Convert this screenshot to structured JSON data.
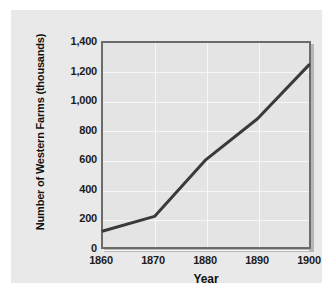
{
  "chart_data": {
    "type": "line",
    "title": "",
    "xlabel": "Year",
    "ylabel": "Number of Western Farms (thousands)",
    "x": [
      1860,
      1870,
      1880,
      1890,
      1900
    ],
    "values": [
      110,
      210,
      600,
      880,
      1250
    ],
    "series": [
      {
        "name": "Number of Western Farms",
        "values": [
          110,
          210,
          600,
          880,
          1250
        ]
      }
    ],
    "xticklabels": [
      "1860",
      "1870",
      "1880",
      "1890",
      "1900"
    ],
    "yticks": [
      0,
      200,
      400,
      600,
      800,
      1000,
      1200,
      1400
    ],
    "yticklabels": [
      "0",
      "200",
      "400",
      "600",
      "800",
      "1,000",
      "1,200",
      "1,400"
    ],
    "xlim": [
      1860,
      1900
    ],
    "ylim": [
      0,
      1400
    ],
    "grid": true,
    "legend": false,
    "line_color": "#3a3a3a",
    "plot_background": "#e4e4e4",
    "figure_background": "#e9e9e9",
    "gridline_color": "#f7f7f7",
    "axis_color": "#6b6b6b"
  }
}
